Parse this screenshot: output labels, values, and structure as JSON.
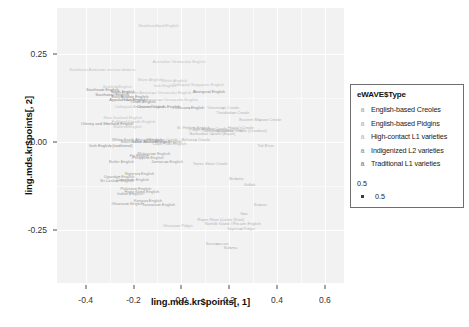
{
  "chart_data": {
    "type": "scatter",
    "title": "",
    "subtitle": "",
    "xlabel": "ling.mds.kr$points[, 1]",
    "ylabel": "ling.mds.kr$points[, 2]",
    "xlim": [
      -0.52,
      0.68
    ],
    "ylim": [
      -0.4,
      0.38
    ],
    "xticks": [
      "-0.4",
      "-0.2",
      "0.0",
      "0.2",
      "0.4",
      "0.6"
    ],
    "xtickvals": [
      -0.4,
      -0.2,
      0.0,
      0.2,
      0.4,
      0.6
    ],
    "yticks": [
      "0.25",
      "0.00",
      "-0.25"
    ],
    "ytickvals": [
      0.25,
      0.0,
      -0.25
    ],
    "grid": true,
    "grid_color": "#ffffff",
    "panel_background": "#f2f2f2",
    "legend_position": "right",
    "label_type": "text-labels",
    "series": [
      {
        "name": "English-based Creoles",
        "color": "#b5b5b5",
        "points": [
          {
            "label": "Jamaican Creole",
            "x": 0.155,
            "y": 0.03
          },
          {
            "label": "Bahamian Creole",
            "x": -0.08,
            "y": 0.005
          },
          {
            "label": "Belizean Creole",
            "x": 0.06,
            "y": 0.005
          },
          {
            "label": "Trinidadian Creole",
            "x": 0.215,
            "y": 0.082
          },
          {
            "label": "Vincentian Creole",
            "x": 0.175,
            "y": 0.095
          },
          {
            "label": "Guyanese Creole (Creolese)",
            "x": 0.25,
            "y": 0.03
          },
          {
            "label": "Eastern Maroon Creole",
            "x": 0.33,
            "y": 0.062
          },
          {
            "label": "Barbadian Creole (Bajan)",
            "x": 0.13,
            "y": 0.022
          },
          {
            "label": "San Andres Creole",
            "x": 0.12,
            "y": 0.038
          },
          {
            "label": "Torres Strait Creole",
            "x": 0.12,
            "y": -0.062
          },
          {
            "label": "Gullah",
            "x": 0.285,
            "y": -0.122
          },
          {
            "label": "Hawai'i Creole",
            "x": 0.248,
            "y": 0.04
          },
          {
            "label": "Sranan",
            "x": 0.33,
            "y": -0.178
          },
          {
            "label": "Saramaccan",
            "x": 0.15,
            "y": -0.29
          },
          {
            "label": "Sulama",
            "x": 0.205,
            "y": -0.3
          },
          {
            "label": "Krio",
            "x": 0.262,
            "y": -0.205
          },
          {
            "label": "Tok Pisin",
            "x": 0.352,
            "y": -0.012
          },
          {
            "label": "Bislama",
            "x": 0.23,
            "y": -0.105
          },
          {
            "label": "Roper River Creole (Kriol)",
            "x": 0.165,
            "y": -0.222
          },
          {
            "label": "Norfolk Island / Pitcairn English",
            "x": 0.215,
            "y": -0.232
          },
          {
            "label": "St. Helena English",
            "x": 0.05,
            "y": 0.04
          },
          {
            "label": "Cape Flats English",
            "x": -0.05,
            "y": -0.005
          }
        ]
      },
      {
        "name": "English-based Pidgins",
        "color": "#bdbdbd",
        "points": [
          {
            "label": "Nigerian Pidgin",
            "x": 0.25,
            "y": -0.248
          },
          {
            "label": "Ghanaian Pidgin",
            "x": -0.015,
            "y": -0.238
          },
          {
            "label": "Cameroon Pidgin",
            "x": 0.195,
            "y": 0.035
          },
          {
            "label": "Pidgin English",
            "x": 0.085,
            "y": 0.035
          }
        ]
      },
      {
        "name": "High-contact L1 varieties",
        "color": "#c4c4c4",
        "points": [
          {
            "label": "Newfoundland English",
            "x": -0.095,
            "y": 0.33
          },
          {
            "label": "Australian Vernacular English",
            "x": -0.01,
            "y": 0.228
          },
          {
            "label": "Southeast American enclave dialects",
            "x": -0.33,
            "y": 0.205
          },
          {
            "label": "Urban African American Vernacular English",
            "x": -0.12,
            "y": 0.138
          },
          {
            "label": "Rural African American Vernacular English",
            "x": -0.09,
            "y": 0.118
          },
          {
            "label": "Colloquial American English",
            "x": -0.175,
            "y": 0.098
          },
          {
            "label": "Colloquial Singapore English",
            "x": 0.07,
            "y": 0.162
          },
          {
            "label": "New Zealand English",
            "x": -0.245,
            "y": 0.068
          },
          {
            "label": "Maltese English",
            "x": -0.225,
            "y": 0.042
          },
          {
            "label": "Falkland Islands English",
            "x": -0.2,
            "y": 0.058
          },
          {
            "label": "Scottish English",
            "x": -0.268,
            "y": 0.155
          },
          {
            "label": "Irish English",
            "x": -0.07,
            "y": 0.16
          },
          {
            "label": "Manx English",
            "x": -0.13,
            "y": 0.175
          },
          {
            "label": "Welsh English",
            "x": -0.03,
            "y": 0.172
          }
        ]
      },
      {
        "name": "Indigenized L2 varieties",
        "color": "#9e9e9e",
        "points": [
          {
            "label": "Indian South African English",
            "x": -0.105,
            "y": 0.0
          },
          {
            "label": "Black South African English",
            "x": -0.15,
            "y": 0.0
          },
          {
            "label": "White South African English",
            "x": -0.185,
            "y": 0.005
          },
          {
            "label": "Hong Kong English",
            "x": -0.165,
            "y": -0.142
          },
          {
            "label": "Indian English",
            "x": -0.215,
            "y": -0.148
          },
          {
            "label": "Pakistani English",
            "x": -0.19,
            "y": -0.132
          },
          {
            "label": "Sri Lankan English",
            "x": -0.27,
            "y": -0.112
          },
          {
            "label": "Ghanaian English",
            "x": -0.225,
            "y": -0.175
          },
          {
            "label": "Tanzanian English",
            "x": -0.095,
            "y": -0.178
          },
          {
            "label": "Kenyan English",
            "x": -0.14,
            "y": -0.168
          },
          {
            "label": "Ugandan English",
            "x": -0.26,
            "y": -0.098
          },
          {
            "label": "Cameroon English",
            "x": -0.205,
            "y": -0.108
          },
          {
            "label": "Nigerian English",
            "x": -0.175,
            "y": -0.092
          },
          {
            "label": "Jamaican English",
            "x": -0.06,
            "y": -0.058
          },
          {
            "label": "Fiji English",
            "x": -0.175,
            "y": -0.04
          },
          {
            "label": "Philippine English",
            "x": -0.14,
            "y": -0.045
          },
          {
            "label": "Malaysian English",
            "x": -0.115,
            "y": -0.035
          },
          {
            "label": "Butler English",
            "x": -0.25,
            "y": -0.058
          }
        ]
      },
      {
        "name": "Traditional L1 varieties",
        "color": "#8f8f8f",
        "points": [
          {
            "label": "Southeast English",
            "x": -0.33,
            "y": 0.148
          },
          {
            "label": "Southwest English",
            "x": -0.29,
            "y": 0.132
          },
          {
            "label": "North English",
            "x": -0.245,
            "y": 0.142
          },
          {
            "label": "East Anglian English",
            "x": -0.215,
            "y": 0.128
          },
          {
            "label": "Appalachian English",
            "x": -0.225,
            "y": 0.118
          },
          {
            "label": "Ozark English",
            "x": -0.16,
            "y": 0.112
          },
          {
            "label": "Aboriginal English",
            "x": 0.115,
            "y": 0.142
          },
          {
            "label": "Channel Islands English",
            "x": -0.095,
            "y": 0.098
          },
          {
            "label": "Orkney and Shetland English",
            "x": -0.31,
            "y": 0.052
          },
          {
            "label": "Irish English (traditional)",
            "x": -0.295,
            "y": -0.012
          },
          {
            "label": "Chicano English",
            "x": 0.035,
            "y": 0.095
          }
        ]
      }
    ],
    "size_legend": {
      "title": "0.5",
      "entries": [
        "0.5"
      ]
    }
  },
  "legend": {
    "title": "eWAVE$Type",
    "key_glyph": "a",
    "items": [
      {
        "label": "English-based Creoles",
        "color": "#b5b5b5"
      },
      {
        "label": "English-based Pidgins",
        "color": "#bdbdbd"
      },
      {
        "label": "High-contact L1 varieties",
        "color": "#c4c4c4"
      },
      {
        "label": "Indigenized L2 varieties",
        "color": "#9e9e9e"
      },
      {
        "label": "Traditional L1 varieties",
        "color": "#8f8f8f"
      }
    ]
  }
}
